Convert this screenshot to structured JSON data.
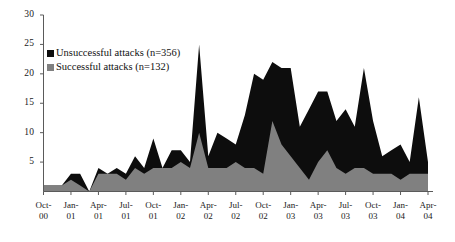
{
  "chart_data": {
    "type": "area",
    "stacked": true,
    "title": "",
    "subtitle": "",
    "xlabel": "",
    "ylabel": "",
    "ylim": [
      0,
      30
    ],
    "yticks": [
      0,
      5,
      10,
      15,
      20,
      25,
      30
    ],
    "ytick_labels": [
      "",
      "5",
      "10",
      "15",
      "20",
      "25",
      "30"
    ],
    "grid": false,
    "legend_position": "upper-left",
    "x": [
      "Oct-00",
      "Nov-00",
      "Dec-00",
      "Jan-01",
      "Feb-01",
      "Mar-01",
      "Apr-01",
      "May-01",
      "Jun-01",
      "Jul-01",
      "Aug-01",
      "Sep-01",
      "Oct-01",
      "Nov-01",
      "Dec-01",
      "Jan-02",
      "Feb-02",
      "Mar-02",
      "Apr-02",
      "May-02",
      "Jun-02",
      "Jul-02",
      "Aug-02",
      "Sep-02",
      "Oct-02",
      "Nov-02",
      "Dec-02",
      "Jan-03",
      "Feb-03",
      "Mar-03",
      "Apr-03",
      "May-03",
      "Jun-03",
      "Jul-03",
      "Aug-03",
      "Sep-03",
      "Oct-03",
      "Nov-03",
      "Dec-03",
      "Jan-04",
      "Feb-04",
      "Mar-04",
      "Apr-04"
    ],
    "xtick_labels": [
      "Oct-00",
      "Jan-01",
      "Apr-01",
      "Jul-01",
      "Oct-01",
      "Jan-02",
      "Apr-02",
      "Jul-02",
      "Oct-02",
      "Jan-03",
      "Apr-03",
      "Jul-03",
      "Oct-03",
      "Jan-04",
      "Apr-04"
    ],
    "xtick_index": [
      0,
      3,
      6,
      9,
      12,
      15,
      18,
      21,
      24,
      27,
      30,
      33,
      36,
      39,
      42
    ],
    "series": [
      {
        "name": "Successful attacks (n=132)",
        "color": "#808080",
        "values": [
          1,
          1,
          1,
          2,
          1,
          0,
          3,
          3,
          3,
          2,
          4,
          3,
          4,
          4,
          4,
          5,
          4,
          10,
          4,
          4,
          4,
          5,
          4,
          4,
          3,
          12,
          8,
          6,
          4,
          2,
          5,
          7,
          4,
          3,
          4,
          4,
          3,
          3,
          3,
          2,
          3,
          3,
          3
        ]
      },
      {
        "name": "Unsuccessful attacks (n=356)",
        "color": "#0d0d0d",
        "values": [
          0,
          0,
          0,
          1,
          2,
          0,
          1,
          0,
          1,
          1,
          2,
          1,
          5,
          0,
          3,
          2,
          1,
          15,
          2,
          6,
          5,
          3,
          9,
          16,
          16,
          10,
          13,
          15,
          7,
          12,
          12,
          10,
          8,
          11,
          7,
          17,
          9,
          3,
          4,
          6,
          2,
          13,
          2
        ]
      }
    ],
    "totals_note": {
      "unsuccessful_total": 356,
      "successful_total": 132
    }
  },
  "legend": {
    "items": [
      {
        "label": "Unsuccessful attacks (n=356)",
        "color": "#0d0d0d"
      },
      {
        "label": "Successful attacks (n=132)",
        "color": "#808080"
      }
    ]
  },
  "axes": {
    "y_labels": [
      "30",
      "25",
      "20",
      "15",
      "10",
      "5"
    ],
    "x_labels_line1": [
      "Oct-",
      "Jan-",
      "Apr-",
      "Jul-",
      "Oct-",
      "Jan-",
      "Apr-",
      "Jul-",
      "Oct-",
      "Jan-",
      "Apr-",
      "Jul-",
      "Oct-",
      "Jan-",
      "Apr-"
    ],
    "x_labels_line2": [
      "00",
      "01",
      "01",
      "01",
      "01",
      "02",
      "02",
      "02",
      "02",
      "03",
      "03",
      "03",
      "03",
      "04",
      "04"
    ]
  },
  "colors": {
    "axis": "#5a5a5a",
    "black_series": "#0d0d0d",
    "gray_series": "#808080",
    "background": "#ffffff"
  }
}
